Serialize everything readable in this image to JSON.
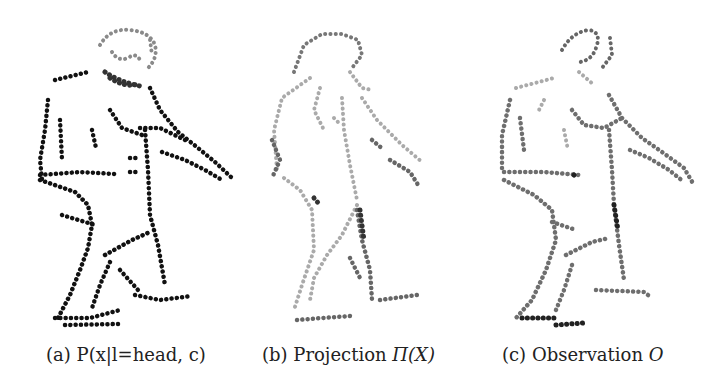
{
  "figure": {
    "panels": [
      {
        "id": "a",
        "caption_label": "(a)",
        "caption_text": "P(x|l=head, c)",
        "description": "Probability map for head label",
        "colors": {
          "body": "#111111",
          "head": "#8a8a8a",
          "neck": "#3a3a3a"
        }
      },
      {
        "id": "b",
        "caption_label": "(b)",
        "caption_text": "Projection",
        "caption_math": "Π(X)",
        "description": "Projected model points",
        "colors": {
          "light": "#a8a8a8",
          "dark": "#555555"
        }
      },
      {
        "id": "c",
        "caption_label": "(c)",
        "caption_text": "Observation",
        "caption_math": "O",
        "description": "Observed edge points",
        "colors": {
          "main": "#6e6e6e",
          "dark": "#222222",
          "light": "#a0a0a0"
        }
      }
    ]
  }
}
